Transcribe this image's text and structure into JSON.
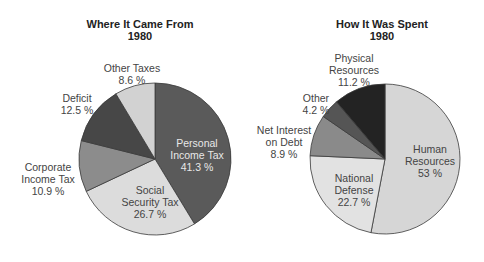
{
  "chart_data": [
    {
      "type": "pie",
      "title": "Where It Came From",
      "subtitle": "1980",
      "categories": [
        "Personal Income Tax",
        "Social Security Tax",
        "Corporate Income Tax",
        "Deficit",
        "Other Taxes"
      ],
      "values": [
        41.3,
        26.7,
        10.9,
        12.5,
        8.6
      ],
      "value_labels": [
        "41.3 %",
        "26.7 %",
        "10.9 %",
        "12.5 %",
        "8.6 %"
      ],
      "colors": [
        "#5a5a5a",
        "#dcdcdc",
        "#8c8c8c",
        "#474747",
        "#d2d2d2"
      ],
      "start_angle": "top, clockwise"
    },
    {
      "type": "pie",
      "title": "How It Was Spent",
      "subtitle": "1980",
      "categories": [
        "Human Resources",
        "National Defense",
        "Net Interest on Debt",
        "Other",
        "Physical Resources"
      ],
      "values": [
        53,
        22.7,
        8.9,
        4.2,
        11.2
      ],
      "value_labels": [
        "53 %",
        "22.7 %",
        "8.9 %",
        "4.2 %",
        "11.2 %"
      ],
      "colors": [
        "#d6d6d6",
        "#e2e2e2",
        "#8a8a8a",
        "#555555",
        "#232323"
      ],
      "start_angle": "top, clockwise"
    }
  ],
  "left": {
    "title": "Where It Came From",
    "year": "1980",
    "labels": {
      "personal_1": "Personal",
      "personal_2": "Income Tax",
      "personal_3": "41.3 %",
      "social_1": "Social",
      "social_2": "Security Tax",
      "social_3": "26.7 %",
      "corporate_1": "Corporate",
      "corporate_2": "Income Tax",
      "corporate_3": "10.9 %",
      "deficit_1": "Deficit",
      "deficit_2": "12.5 %",
      "other_1": "Other Taxes",
      "other_2": "8.6 %"
    }
  },
  "right": {
    "title": "How It Was Spent",
    "year": "1980",
    "labels": {
      "human_1": "Human",
      "human_2": "Resources",
      "human_3": "53 %",
      "defense_1": "National",
      "defense_2": "Defense",
      "defense_3": "22.7 %",
      "interest_1": "Net Interest",
      "interest_2": "on Debt",
      "interest_3": "8.9 %",
      "other_1": "Other",
      "other_2": "4.2 %",
      "physical_1": "Physical",
      "physical_2": "Resources",
      "physical_3": "11.2 %"
    }
  }
}
